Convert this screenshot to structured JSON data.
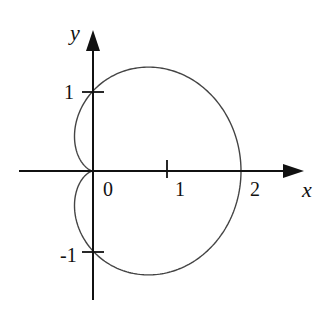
{
  "figure": {
    "type": "polar-curve",
    "equation": "r = 1 + cos θ",
    "curve_name": "cardioid"
  },
  "axes": {
    "x_label": "x",
    "y_label": "y",
    "origin_label": "0",
    "x_ticks": [
      {
        "value": 1,
        "label": "1"
      },
      {
        "value": 2,
        "label": "2"
      }
    ],
    "y_ticks": [
      {
        "value": 1,
        "label": "1"
      },
      {
        "value": -1,
        "label": "-1"
      }
    ]
  },
  "geometry": {
    "origin_px": [
      93,
      171
    ],
    "x_unit_px": 74,
    "y_unit_px": 80,
    "x_axis_range_px": [
      19,
      304
    ],
    "y_axis_range_px": [
      300,
      30
    ]
  },
  "colors": {
    "axis": "#111111",
    "curve": "#444444",
    "background": "#ffffff"
  }
}
